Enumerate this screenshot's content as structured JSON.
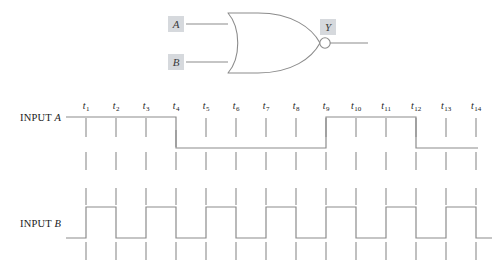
{
  "figure": {
    "gate": {
      "type": "NOR",
      "name": "nor-gate",
      "inputs": [
        {
          "label": "A",
          "name": "gate-input-a"
        },
        {
          "label": "B",
          "name": "gate-input-b"
        }
      ],
      "output": {
        "label": "Y",
        "name": "gate-output-y"
      },
      "has_inversion_bubble": true
    },
    "timing": {
      "tick_labels": [
        "t1",
        "t2",
        "t3",
        "t4",
        "t5",
        "t6",
        "t7",
        "t8",
        "t9",
        "t10",
        "t11",
        "t12",
        "t13",
        "t14"
      ],
      "tick_label_base": "t",
      "tick_subscripts": [
        "1",
        "2",
        "3",
        "4",
        "5",
        "6",
        "7",
        "8",
        "9",
        "10",
        "11",
        "12",
        "13",
        "14"
      ],
      "waveforms": [
        {
          "name": "waveform-input-a",
          "label_prefix": "INPUT ",
          "label_signal": "A",
          "levels": [
            1,
            1,
            1,
            0,
            0,
            0,
            0,
            1,
            1,
            1,
            0,
            0,
            0,
            0
          ],
          "start_level": 1,
          "end_level": 0,
          "description": "High until t4, low until t8, high until t11, low thereafter"
        },
        {
          "name": "waveform-input-b",
          "label_prefix": "INPUT ",
          "label_signal": "B",
          "levels": [
            1,
            0,
            1,
            0,
            1,
            0,
            1,
            0,
            1,
            0,
            1,
            0,
            1,
            0
          ],
          "start_level": 0,
          "end_level": 0,
          "description": "Square wave alternating high at odd ticks, low at even ticks"
        }
      ]
    }
  },
  "colors": {
    "line": "#8c8c8c",
    "gate_stroke": "#8c8c8c",
    "label_box_bg": "#d6d9dd",
    "text": "#1a1a1a",
    "background": "#ffffff"
  }
}
